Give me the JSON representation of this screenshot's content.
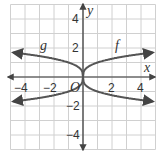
{
  "chart_data": {
    "type": "line",
    "title": "",
    "xlabel": "x",
    "ylabel": "y",
    "origin_label": "O",
    "xlim": [
      -5,
      5
    ],
    "ylim": [
      -5,
      5
    ],
    "grid": true,
    "x_tick_labels": [
      "−4",
      "−2",
      "2",
      "4"
    ],
    "y_tick_labels": [
      "4",
      "2",
      "−2",
      "−4"
    ],
    "series": [
      {
        "name": "f",
        "label_position": "upper-right",
        "description": "upper right branch, y = cube root of x",
        "x": [
          0,
          1,
          2,
          3,
          4,
          4.8
        ],
        "y": [
          0,
          1,
          1.26,
          1.44,
          1.59,
          1.69
        ]
      },
      {
        "name": "g",
        "label_position": "upper-left",
        "description": "upper left branch, reflection of f across y-axis",
        "x": [
          -4.8,
          -4,
          -3,
          -2,
          -1,
          0
        ],
        "y": [
          1.69,
          1.59,
          1.44,
          1.26,
          1,
          0
        ]
      },
      {
        "name": "",
        "description": "lower right branch",
        "x": [
          0,
          1,
          2,
          3,
          4,
          4.8
        ],
        "y": [
          0,
          -1,
          -1.26,
          -1.44,
          -1.59,
          -1.69
        ]
      },
      {
        "name": "",
        "description": "lower left branch",
        "x": [
          -4.8,
          -4,
          -3,
          -2,
          -1,
          0
        ],
        "y": [
          -1.69,
          -1.59,
          -1.44,
          -1.26,
          -1,
          0
        ]
      }
    ]
  },
  "labels": {
    "f": "f",
    "g": "g",
    "x_axis": "x",
    "y_axis": "y",
    "origin": "O",
    "xm4": "−4",
    "xm2": "−2",
    "x2": "2",
    "x4": "4",
    "y4": "4",
    "y2": "2",
    "ym2": "−2",
    "ym4": "−4"
  }
}
